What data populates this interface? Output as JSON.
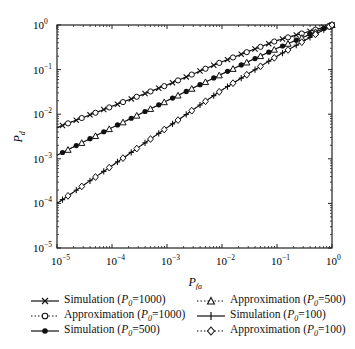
{
  "chart_data": {
    "type": "line",
    "title": "",
    "xlabel": "P_fa",
    "ylabel": "P_d",
    "xscale": "log",
    "yscale": "log",
    "xlim": [
      1e-05,
      1
    ],
    "ylim": [
      1e-05,
      1
    ],
    "x_ticks": [
      "10^-5",
      "10^-4",
      "10^-3",
      "10^-2",
      "10^-1",
      "10^0"
    ],
    "y_ticks": [
      "10^-5",
      "10^-4",
      "10^-3",
      "10^-2",
      "10^-1",
      "10^0"
    ],
    "grid": false,
    "legend_position": "bottom",
    "x": [
      1e-05,
      0.0001,
      0.001,
      0.01,
      0.1,
      1
    ],
    "series": [
      {
        "name": "Simulation (P0=1000)",
        "style": "solid",
        "marker": "x",
        "values": [
          0.005,
          0.015,
          0.045,
          0.15,
          0.45,
          1.0
        ]
      },
      {
        "name": "Approximation (P0=1000)",
        "style": "dotted",
        "marker": "circle",
        "values": [
          0.005,
          0.015,
          0.045,
          0.15,
          0.45,
          1.0
        ]
      },
      {
        "name": "Simulation (P0=500)",
        "style": "solid",
        "marker": "filled-circle",
        "values": [
          0.0012,
          0.005,
          0.02,
          0.08,
          0.3,
          1.0
        ]
      },
      {
        "name": "Approximation (P0=500)",
        "style": "dotted",
        "marker": "triangle",
        "values": [
          0.0012,
          0.005,
          0.02,
          0.08,
          0.3,
          1.0
        ]
      },
      {
        "name": "Simulation (P0=100)",
        "style": "solid",
        "marker": "plus",
        "values": [
          0.0001,
          0.0007,
          0.005,
          0.035,
          0.2,
          1.0
        ]
      },
      {
        "name": "Approximation (P0=100)",
        "style": "dotted",
        "marker": "diamond",
        "values": [
          0.0001,
          0.0007,
          0.005,
          0.035,
          0.2,
          1.0
        ]
      }
    ]
  },
  "axes": {
    "x_label_main": "P",
    "x_label_sub": "fa",
    "y_label_main": "P",
    "y_label_sub": "d",
    "tick_base": "10",
    "tick_exponents": [
      "−5",
      "−4",
      "−3",
      "−2",
      "−1",
      "0"
    ]
  },
  "legend": {
    "items": [
      {
        "prefix": "Simulation (",
        "var": "P",
        "sub": "0",
        "suffix": "=1000)"
      },
      {
        "prefix": "Approximation (",
        "var": "P",
        "sub": "0",
        "suffix": "=1000)"
      },
      {
        "prefix": "Simulation (",
        "var": "P",
        "sub": "0",
        "suffix": "=500)"
      },
      {
        "prefix": "Approximation (",
        "var": "P",
        "sub": "0",
        "suffix": "=500)"
      },
      {
        "prefix": "Simulation (",
        "var": "P",
        "sub": "0",
        "suffix": "=100)"
      },
      {
        "prefix": "Approximation (",
        "var": "P",
        "sub": "0",
        "suffix": "=100)"
      }
    ]
  },
  "colors": {
    "line": "#111111",
    "axis": "#222222",
    "background": "#ffffff"
  }
}
